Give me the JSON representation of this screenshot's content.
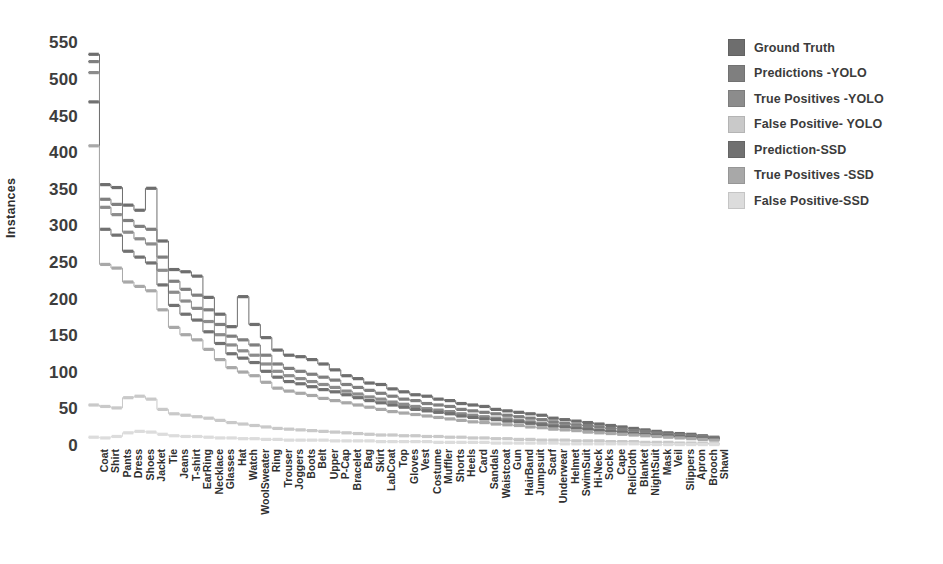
{
  "chart_data": {
    "type": "line",
    "title": "",
    "xlabel": "",
    "ylabel": "Instances",
    "ylim": [
      0,
      560
    ],
    "yticks": [
      0,
      50,
      100,
      150,
      200,
      250,
      300,
      350,
      400,
      450,
      500,
      550
    ],
    "grid": false,
    "legend_position": "right",
    "style": "step",
    "categories": [
      "Coat",
      "Shirt",
      "Pants",
      "Dress",
      "Shoes",
      "Jacket",
      "Tie",
      "Jeans",
      "T-shirt",
      "EarRing",
      "Necklace",
      "Glasses",
      "Hat",
      "Watch",
      "WoolSweater",
      "Ring",
      "Trouser",
      "Joggers",
      "Boots",
      "Belt",
      "Upper",
      "P-Cap",
      "Bracelet",
      "Bag",
      "Skirt",
      "LabCoat",
      "Top",
      "Gloves",
      "Vest",
      "Costume",
      "Muffler",
      "Shorts",
      "Heels",
      "Card",
      "Sandals",
      "Waistcoat",
      "Gun",
      "HairBand",
      "Jumpsuit",
      "Scarf",
      "Underwear",
      "Helmet",
      "SwimSuit",
      "Hi-Neck",
      "Socks",
      "Cape",
      "ReliCloth",
      "Blanket",
      "NightSuit",
      "Mask",
      "Veil",
      "Slippers",
      "Apron",
      "Brooch",
      "Shawl"
    ],
    "series": [
      {
        "name": "Ground Truth",
        "color": "#6e6e6e",
        "values": [
          535,
          357,
          353,
          329,
          322,
          352,
          280,
          241,
          238,
          232,
          203,
          180,
          163,
          204,
          166,
          148,
          131,
          124,
          122,
          118,
          112,
          104,
          96,
          92,
          86,
          84,
          78,
          74,
          70,
          68,
          64,
          62,
          58,
          56,
          54,
          50,
          48,
          46,
          44,
          42,
          38,
          36,
          34,
          32,
          30,
          28,
          26,
          24,
          22,
          20,
          18,
          17,
          16,
          14,
          12
        ]
      },
      {
        "name": "Predictions -YOLO",
        "color": "#7f7f7f",
        "values": [
          525,
          337,
          330,
          308,
          300,
          296,
          258,
          225,
          214,
          206,
          186,
          166,
          150,
          145,
          138,
          124,
          112,
          106,
          102,
          98,
          94,
          90,
          84,
          80,
          76,
          72,
          68,
          64,
          62,
          58,
          56,
          54,
          50,
          48,
          46,
          44,
          42,
          40,
          38,
          36,
          33,
          31,
          29,
          28,
          26,
          24,
          23,
          21,
          20,
          18,
          16,
          15,
          14,
          13,
          11
        ]
      },
      {
        "name": "True Positives -YOLO",
        "color": "#8c8c8c",
        "values": [
          510,
          326,
          316,
          292,
          283,
          276,
          240,
          210,
          198,
          188,
          170,
          152,
          138,
          130,
          124,
          112,
          102,
          96,
          92,
          88,
          84,
          80,
          75,
          71,
          67,
          64,
          60,
          57,
          54,
          51,
          49,
          47,
          44,
          42,
          40,
          38,
          37,
          35,
          33,
          31,
          29,
          27,
          26,
          24,
          22,
          21,
          20,
          18,
          17,
          16,
          14,
          13,
          12,
          11,
          10
        ]
      },
      {
        "name": "False Positive- YOLO",
        "color": "#c9c9c9",
        "values": [
          56,
          54,
          52,
          66,
          68,
          64,
          50,
          44,
          42,
          40,
          38,
          35,
          32,
          30,
          28,
          26,
          24,
          23,
          22,
          21,
          20,
          19,
          18,
          17,
          16,
          15,
          15,
          14,
          14,
          13,
          13,
          12,
          12,
          11,
          11,
          10,
          10,
          9,
          9,
          8,
          8,
          8,
          7,
          7,
          7,
          6,
          6,
          6,
          5,
          5,
          5,
          4,
          4,
          4,
          3
        ]
      },
      {
        "name": "Prediction-SSD",
        "color": "#717171",
        "values": [
          470,
          296,
          288,
          266,
          258,
          250,
          220,
          192,
          180,
          172,
          156,
          140,
          126,
          120,
          114,
          102,
          94,
          88,
          85,
          81,
          77,
          74,
          70,
          66,
          62,
          59,
          56,
          53,
          50,
          48,
          46,
          44,
          41,
          39,
          37,
          36,
          34,
          33,
          31,
          29,
          27,
          26,
          24,
          23,
          21,
          20,
          19,
          17,
          16,
          15,
          14,
          13,
          12,
          11,
          10
        ]
      },
      {
        "name": "True Positives -SSD",
        "color": "#a8a8a8",
        "values": [
          410,
          248,
          243,
          224,
          218,
          212,
          186,
          162,
          152,
          145,
          132,
          118,
          107,
          101,
          96,
          87,
          79,
          75,
          72,
          69,
          65,
          62,
          59,
          56,
          53,
          50,
          47,
          45,
          43,
          41,
          39,
          37,
          35,
          33,
          32,
          30,
          29,
          28,
          26,
          25,
          23,
          22,
          21,
          19,
          18,
          17,
          16,
          15,
          14,
          13,
          12,
          11,
          10,
          9,
          8
        ]
      },
      {
        "name": "False Positive-SSD",
        "color": "#dcdcdc",
        "values": [
          12,
          11,
          13,
          18,
          20,
          19,
          16,
          14,
          13,
          13,
          12,
          11,
          11,
          10,
          10,
          9,
          9,
          8,
          8,
          8,
          8,
          7,
          7,
          7,
          7,
          6,
          6,
          6,
          6,
          6,
          5,
          5,
          5,
          5,
          5,
          4,
          4,
          4,
          4,
          4,
          4,
          3,
          3,
          3,
          3,
          3,
          3,
          3,
          2,
          2,
          2,
          2,
          2,
          2,
          2
        ]
      }
    ]
  },
  "legend": {
    "items": [
      {
        "label": "Ground Truth",
        "color": "#6e6e6e"
      },
      {
        "label": "Predictions -YOLO",
        "color": "#7f7f7f"
      },
      {
        "label": "True Positives -YOLO",
        "color": "#8c8c8c"
      },
      {
        "label": "False Positive- YOLO",
        "color": "#c9c9c9"
      },
      {
        "label": "Prediction-SSD",
        "color": "#717171"
      },
      {
        "label": "True Positives -SSD",
        "color": "#a8a8a8"
      },
      {
        "label": "False Positive-SSD",
        "color": "#dcdcdc"
      }
    ]
  },
  "axis": {
    "y_title": "Instances",
    "y_tick_labels": [
      "550",
      "500",
      "450",
      "400",
      "350",
      "300",
      "250",
      "200",
      "150",
      "100",
      "50",
      "0"
    ]
  }
}
